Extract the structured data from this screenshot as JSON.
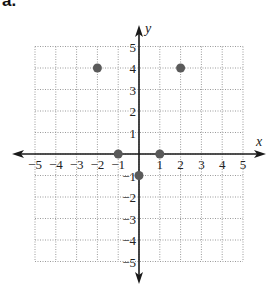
{
  "header": {
    "label": "a."
  },
  "chart_data": {
    "type": "scatter",
    "title": "",
    "xlabel": "x",
    "ylabel": "y",
    "xlim": [
      -5,
      5
    ],
    "ylim": [
      -5,
      5
    ],
    "grid": true,
    "grid_style": "dotted",
    "x_ticks": [
      "−5",
      "−4",
      "−3",
      "−2",
      "−1",
      "1",
      "2",
      "3",
      "4",
      "5"
    ],
    "y_ticks": [
      "5",
      "4",
      "3",
      "2",
      "1",
      "−1",
      "−2",
      "−3",
      "−4",
      "−5"
    ],
    "series": [
      {
        "name": "points",
        "points": [
          {
            "x": -2,
            "y": 4
          },
          {
            "x": 2,
            "y": 4
          },
          {
            "x": -1,
            "y": 0
          },
          {
            "x": 1,
            "y": 0
          },
          {
            "x": 0,
            "y": -1
          }
        ]
      }
    ],
    "colors": {
      "point": "#5a5a5a",
      "axis": "#1a1a1a",
      "grid": "#9a9a9a"
    }
  }
}
